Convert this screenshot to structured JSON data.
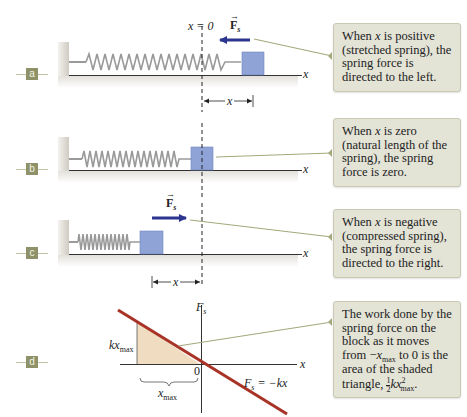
{
  "panels": [
    {
      "id": "a",
      "label": "a",
      "callout": {
        "pre": "When ",
        "var": "x",
        "post": " is positive (stretched spring), the spring force is directed to the left."
      },
      "force_label": "F",
      "force_sub": "s",
      "force_direction": "left",
      "origin_label": "x = 0",
      "axis_label": "x",
      "displacement_label": "x"
    },
    {
      "id": "b",
      "label": "b",
      "callout": {
        "pre": "When ",
        "var": "x",
        "post": " is zero (natural length of the spring), the spring force is zero."
      },
      "axis_label": "x"
    },
    {
      "id": "c",
      "label": "c",
      "callout": {
        "pre": "When ",
        "var": "x",
        "post": " is negative (compressed spring), the spring force is directed to the right."
      },
      "force_label": "F",
      "force_sub": "s",
      "force_direction": "right",
      "axis_label": "x",
      "displacement_label": "x"
    },
    {
      "id": "d",
      "label": "d",
      "callout": {
        "line1": "The work done by the spring force on the block as it moves from ",
        "neg": "−",
        "xmax_var": "x",
        "xmax_sub": "max",
        "line2": " to 0 is the area of the shaded triangle, ",
        "frac_num": "1",
        "frac_den": "2",
        "kx": "kx",
        "sq": "2",
        "end_sub": "max",
        "end": "."
      },
      "graph": {
        "y_axis_label": "F",
        "y_axis_sub": "s",
        "x_axis_label": "x",
        "origin_label": "0",
        "height_label_k": "kx",
        "height_label_sub": "max",
        "width_label_var": "x",
        "width_label_sub": "max",
        "equation_lhs": "F",
        "equation_sub": "s",
        "equation_rhs": " = −kx"
      }
    }
  ],
  "colors": {
    "block": "#8fa3d6",
    "block_edge": "#7186bf",
    "spring": "#9a9a9a",
    "force_arrow": "#2b3590",
    "graph_line": "#a83226",
    "shaded_triangle": "#f0dcc0",
    "callout_bg": "#e3e3d6",
    "leader_line": "#a5a87a",
    "panel_label_bg": "#8f9268",
    "wall": "#d9d6cf"
  }
}
